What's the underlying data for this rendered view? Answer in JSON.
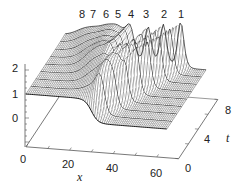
{
  "chart_data": {
    "type": "surface3d",
    "title": "",
    "xlabel": "x",
    "ylabel": "t",
    "zlabel": "",
    "x_ticks": [
      0,
      20,
      40,
      60
    ],
    "t_ticks": [
      0,
      4,
      8
    ],
    "z_ticks": [
      0,
      1,
      2
    ],
    "xlim": [
      0,
      65
    ],
    "tlim": [
      0,
      8
    ],
    "zlim": [
      -1.2,
      2
    ],
    "peak_labels": [
      "8",
      "7",
      "6",
      "5",
      "4",
      "3",
      "2",
      "1"
    ],
    "kink": {
      "x_center": 30,
      "width": 3,
      "upper_level": 1,
      "lower_level": 0
    },
    "solitons": [
      {
        "label": "1",
        "x_at_t0": 30,
        "x_at_t8": 53,
        "peak_height": 1.9
      },
      {
        "label": "2",
        "x_at_t0": 30,
        "x_at_t8": 45,
        "peak_height": 1.75
      },
      {
        "label": "3",
        "x_at_t0": 30,
        "x_at_t8": 38,
        "peak_height": 1.6
      },
      {
        "label": "4",
        "x_at_t0": 30,
        "x_at_t8": 30,
        "peak_height": 1.5
      },
      {
        "label": "5",
        "x_at_t0": 30,
        "x_at_t8": 24,
        "peak_height": 1.4
      },
      {
        "label": "6",
        "x_at_t0": 30,
        "x_at_t8": 19,
        "peak_height": 1.35
      },
      {
        "label": "7",
        "x_at_t0": 30,
        "x_at_t8": 13,
        "peak_height": 1.25
      },
      {
        "label": "8",
        "x_at_t0": 30,
        "x_at_t8": 8,
        "peak_height": 1.2
      }
    ],
    "grid": false,
    "legend": "none"
  },
  "labels": {
    "x_axis": "x",
    "t_axis": "t",
    "x_ticks": [
      "0",
      "20",
      "40",
      "60"
    ],
    "t_ticks": [
      "0",
      "4",
      "8"
    ],
    "z_ticks": [
      "0",
      "1",
      "2"
    ],
    "peaks": [
      "8",
      "7",
      "6",
      "5",
      "4",
      "3",
      "2",
      "1"
    ]
  },
  "colors": {
    "line": "#3a3a3a",
    "heavy_line": "#1a1a1a",
    "axis": "#555555",
    "fill": "#ffffff"
  }
}
